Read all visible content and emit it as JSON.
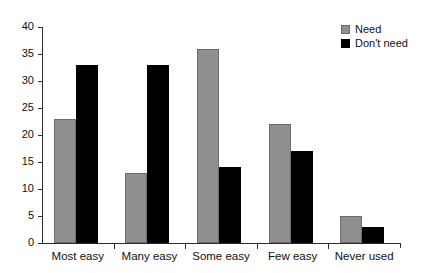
{
  "chart_data": {
    "type": "bar",
    "title": "",
    "subtitle": "",
    "xlabel": "",
    "ylabel": "",
    "categories": [
      "Most easy",
      "Many easy",
      "Some easy",
      "Few easy",
      "Never used"
    ],
    "series": [
      {
        "name": "Need",
        "color": "#8f8f8f",
        "values": [
          23,
          13,
          36,
          22,
          5
        ]
      },
      {
        "name": "Don't need",
        "color": "#000000",
        "values": [
          33,
          33,
          14,
          17,
          3
        ]
      }
    ],
    "ylim": [
      0,
      40
    ],
    "ytick_step": 5,
    "ytick_labels": [
      "0",
      "5",
      "10",
      "15",
      "20",
      "25",
      "30",
      "35",
      "40"
    ],
    "ytick_values": [
      0,
      5,
      10,
      15,
      20,
      25,
      30,
      35,
      40
    ],
    "grid": false,
    "legend_position": "top-right",
    "legend_entries": [
      {
        "label": "Need",
        "color": "#8f8f8f"
      },
      {
        "label": "Don't need",
        "color": "#000000"
      }
    ],
    "background_color": "#ffffff",
    "axis_color": "#2b2b2b"
  }
}
